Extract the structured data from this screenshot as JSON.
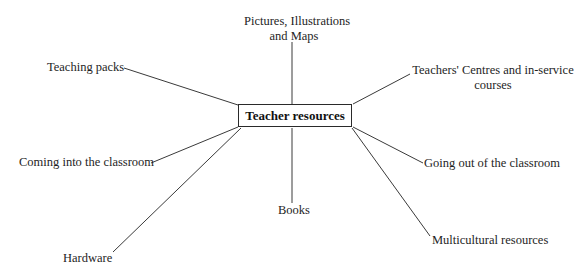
{
  "diagram": {
    "type": "mind-map",
    "center": {
      "label": "Teacher resources"
    },
    "branches": [
      {
        "id": "pictures",
        "label_lines": [
          "Pictures, Illustrations",
          "and Maps"
        ]
      },
      {
        "id": "teaching-packs",
        "label": "Teaching packs"
      },
      {
        "id": "teachers-centres",
        "label_lines": [
          "Teachers' Centres and in-service",
          "courses"
        ]
      },
      {
        "id": "coming-into",
        "label": "Coming into the classroom"
      },
      {
        "id": "going-out",
        "label": "Going out of the classroom"
      },
      {
        "id": "books",
        "label": "Books"
      },
      {
        "id": "hardware",
        "label": "Hardware"
      },
      {
        "id": "multicultural",
        "label": "Multicultural resources"
      }
    ],
    "colors": {
      "line": "#3a3a3a",
      "text": "#1e1e1e",
      "background": "#ffffff"
    }
  }
}
